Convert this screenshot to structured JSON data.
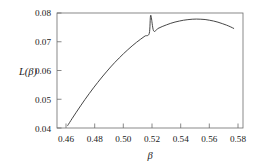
{
  "chart_data": {
    "type": "line",
    "title": "",
    "subtitle": "",
    "xlabel": "β",
    "ylabel": "L(β)",
    "xlim": [
      0.4545,
      0.5845
    ],
    "ylim": [
      0.0396,
      0.0803
    ],
    "grid": false,
    "legend": null,
    "xticks": [
      0.46,
      0.48,
      0.5,
      0.52,
      0.54,
      0.56,
      0.58
    ],
    "xtick_labels": [
      "0.46",
      "0.48",
      "0.50",
      "0.52",
      "0.54",
      "0.56",
      "0.58"
    ],
    "yticks": [
      0.04,
      0.05,
      0.06,
      0.07,
      0.08
    ],
    "ytick_labels": [
      "0.04",
      "0.05",
      "0.06",
      "0.07",
      "0.08"
    ],
    "series": [
      {
        "name": "L(β)",
        "color": "#3c3c3c",
        "x": [
          0.462,
          0.465,
          0.468,
          0.471,
          0.474,
          0.477,
          0.48,
          0.483,
          0.486,
          0.489,
          0.492,
          0.495,
          0.498,
          0.501,
          0.504,
          0.507,
          0.51,
          0.513,
          0.516,
          0.519,
          0.522,
          0.525,
          0.528,
          0.531,
          0.534,
          0.537,
          0.54,
          0.543,
          0.546,
          0.549,
          0.552,
          0.555,
          0.558,
          0.561,
          0.564,
          0.567,
          0.57,
          0.573,
          0.576,
          0.578
        ],
        "y": [
          0.0405,
          0.0429,
          0.0452,
          0.04745,
          0.04965,
          0.05175,
          0.0538,
          0.05575,
          0.05765,
          0.05945,
          0.0612,
          0.06285,
          0.0644,
          0.0659,
          0.0673,
          0.06865,
          0.0699,
          0.07105,
          0.07215,
          0.0731,
          0.074,
          0.0748,
          0.0755,
          0.0761,
          0.07665,
          0.0771,
          0.07745,
          0.07775,
          0.07795,
          0.0781,
          0.07815,
          0.0781,
          0.078,
          0.07775,
          0.07745,
          0.07705,
          0.07655,
          0.076,
          0.07535,
          0.07485
        ],
        "peak": {
          "x": 0.52,
          "y": 0.0795
        }
      }
    ]
  },
  "axes": {
    "y_label_text": "L(β)",
    "x_label_text": "β"
  }
}
